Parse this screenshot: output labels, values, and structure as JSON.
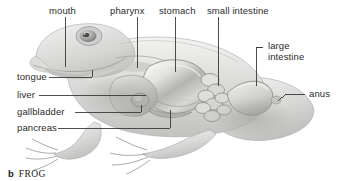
{
  "figure": {
    "caption_letter": "b",
    "caption_word": "FROG",
    "background_color": "#ffffff",
    "line_color": "#3a3a3a",
    "text_color": "#2b2b2b"
  },
  "labels": {
    "mouth": "mouth",
    "pharynx": "pharynx",
    "stomach": "stomach",
    "small_intestine": "small intestine",
    "large_intestine_line1": "large",
    "large_intestine_line2": "intestine",
    "anus": "anus",
    "tongue": "tongue",
    "liver": "liver",
    "gallbladder": "gallbladder",
    "pancreas": "pancreas"
  },
  "organs": [
    {
      "name": "mouth"
    },
    {
      "name": "pharynx"
    },
    {
      "name": "stomach"
    },
    {
      "name": "small intestine"
    },
    {
      "name": "large intestine"
    },
    {
      "name": "anus"
    },
    {
      "name": "tongue"
    },
    {
      "name": "liver"
    },
    {
      "name": "gallbladder"
    },
    {
      "name": "pancreas"
    }
  ]
}
